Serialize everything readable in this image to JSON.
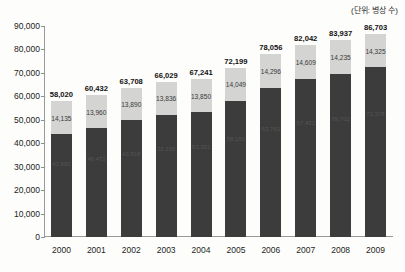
{
  "caption": {
    "unit_note": "(단위: 병상 수)"
  },
  "axis": {
    "y_ticks": [
      "90,000",
      "80,000",
      "70,000",
      "60,000",
      "50,000",
      "40,000",
      "30,000",
      "20,000",
      "10,000",
      "0"
    ],
    "y_min": 0,
    "y_max": 90000,
    "y_step": 10000,
    "x_labels": [
      "2000",
      "2001",
      "2002",
      "2003",
      "2004",
      "2005",
      "2006",
      "2007",
      "2008",
      "2009"
    ]
  },
  "colors": {
    "bar_bottom": "#3c3c3c",
    "bar_top": "#d4d4d2",
    "axis": "#9a9a9a",
    "background": "#fdfdfb",
    "text": "#1a1a1a"
  },
  "chart_data": {
    "type": "bar",
    "title": "",
    "subtitle": "",
    "xlabel": "",
    "ylabel": "",
    "unit": "(단위: 병상 수)",
    "stacked": true,
    "grid": false,
    "legend": "none",
    "ylim": [
      0,
      90000
    ],
    "ytick_values": [
      0,
      10000,
      20000,
      30000,
      40000,
      50000,
      60000,
      70000,
      80000,
      90000
    ],
    "categories": [
      "2000",
      "2001",
      "2002",
      "2003",
      "2004",
      "2005",
      "2006",
      "2007",
      "2008",
      "2009"
    ],
    "series": [
      {
        "name": "lower-segment",
        "color": "#3c3c3c",
        "values": [
          43885,
          46472,
          49818,
          52193,
          53391,
          58150,
          63760,
          67433,
          69702,
          72378
        ],
        "labels": [
          "43,885",
          "46,472",
          "49,818",
          "52,193",
          "53,391",
          "58,150",
          "63,760",
          "67,433",
          "69,702",
          "72,378"
        ]
      },
      {
        "name": "upper-segment",
        "color": "#d4d4d2",
        "values": [
          14135,
          13960,
          13890,
          13836,
          13850,
          14049,
          14296,
          14609,
          14235,
          14325
        ],
        "labels": [
          "14,135",
          "13,960",
          "13,890",
          "13,836",
          "13,850",
          "14,049",
          "14,296",
          "14,609",
          "14,235",
          "14,325"
        ]
      }
    ],
    "totals": [
      58020,
      60432,
      63708,
      66029,
      67241,
      72199,
      78056,
      82042,
      83937,
      86703
    ],
    "total_labels": [
      "58,020",
      "60,432",
      "63,708",
      "66,029",
      "67,241",
      "72,199",
      "78,056",
      "82,042",
      "83,937",
      "86,703"
    ]
  }
}
